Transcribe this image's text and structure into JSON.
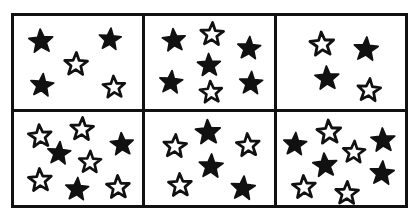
{
  "worksheet": {
    "title": "Star Counting Grid",
    "description": "Black and white worksheet image showing a 2 row by 3 column grid of boxes, each containing a mix of filled (black) and outline (white) five-pointed stars.",
    "background_color": "#ffffff",
    "line_color": "#111111",
    "filled_star_color": "#111111",
    "outline_star_fill": "#ffffff",
    "grid": {
      "rows": 2,
      "columns": 3,
      "border_width_px": 3
    },
    "cells": [
      {
        "id": "cell-1",
        "position": "top-left",
        "row": 1,
        "column": 1,
        "filled_count": 3,
        "outline_count": 2,
        "total_count": 5,
        "stars": [
          {
            "type": "filled",
            "x": 21,
            "y": 27,
            "size": 26,
            "rotation": -4
          },
          {
            "type": "filled",
            "x": 75,
            "y": 25,
            "size": 24,
            "rotation": 5
          },
          {
            "type": "outline",
            "x": 48,
            "y": 52,
            "size": 25,
            "rotation": 2
          },
          {
            "type": "filled",
            "x": 22,
            "y": 74,
            "size": 25,
            "rotation": 6
          },
          {
            "type": "outline",
            "x": 78,
            "y": 76,
            "size": 24,
            "rotation": -3
          }
        ]
      },
      {
        "id": "cell-2",
        "position": "top-middle",
        "row": 1,
        "column": 2,
        "filled_count": 5,
        "outline_count": 2,
        "total_count": 7,
        "stars": [
          {
            "type": "filled",
            "x": 22,
            "y": 26,
            "size": 25,
            "rotation": -5
          },
          {
            "type": "outline",
            "x": 52,
            "y": 19,
            "size": 25,
            "rotation": 3
          },
          {
            "type": "filled",
            "x": 81,
            "y": 34,
            "size": 25,
            "rotation": 4
          },
          {
            "type": "filled",
            "x": 50,
            "y": 53,
            "size": 25,
            "rotation": -2
          },
          {
            "type": "filled",
            "x": 20,
            "y": 71,
            "size": 25,
            "rotation": 5
          },
          {
            "type": "outline",
            "x": 51,
            "y": 82,
            "size": 24,
            "rotation": -4
          },
          {
            "type": "filled",
            "x": 82,
            "y": 72,
            "size": 25,
            "rotation": 3
          }
        ]
      },
      {
        "id": "cell-3",
        "position": "top-right",
        "row": 1,
        "column": 3,
        "filled_count": 2,
        "outline_count": 2,
        "total_count": 4,
        "stars": [
          {
            "type": "outline",
            "x": 35,
            "y": 30,
            "size": 26,
            "rotation": -4
          },
          {
            "type": "filled",
            "x": 70,
            "y": 35,
            "size": 26,
            "rotation": 4
          },
          {
            "type": "filled",
            "x": 39,
            "y": 67,
            "size": 26,
            "rotation": -3
          },
          {
            "type": "outline",
            "x": 72,
            "y": 80,
            "size": 25,
            "rotation": 5
          }
        ]
      },
      {
        "id": "cell-4",
        "position": "bottom-left",
        "row": 2,
        "column": 1,
        "filled_count": 3,
        "outline_count": 5,
        "total_count": 8,
        "stars": [
          {
            "type": "outline",
            "x": 20,
            "y": 26,
            "size": 25,
            "rotation": -5
          },
          {
            "type": "outline",
            "x": 53,
            "y": 18,
            "size": 25,
            "rotation": 3
          },
          {
            "type": "filled",
            "x": 35,
            "y": 44,
            "size": 25,
            "rotation": 5
          },
          {
            "type": "filled",
            "x": 84,
            "y": 34,
            "size": 25,
            "rotation": -4
          },
          {
            "type": "outline",
            "x": 59,
            "y": 54,
            "size": 24,
            "rotation": 2
          },
          {
            "type": "outline",
            "x": 20,
            "y": 73,
            "size": 25,
            "rotation": -3
          },
          {
            "type": "filled",
            "x": 49,
            "y": 83,
            "size": 25,
            "rotation": 4
          },
          {
            "type": "outline",
            "x": 81,
            "y": 81,
            "size": 25,
            "rotation": -2
          }
        ]
      },
      {
        "id": "cell-5",
        "position": "bottom-middle",
        "row": 2,
        "column": 2,
        "filled_count": 3,
        "outline_count": 3,
        "total_count": 6,
        "stars": [
          {
            "type": "filled",
            "x": 49,
            "y": 22,
            "size": 27,
            "rotation": -3
          },
          {
            "type": "outline",
            "x": 23,
            "y": 37,
            "size": 25,
            "rotation": 4
          },
          {
            "type": "outline",
            "x": 80,
            "y": 36,
            "size": 25,
            "rotation": -4
          },
          {
            "type": "filled",
            "x": 51,
            "y": 58,
            "size": 26,
            "rotation": 3
          },
          {
            "type": "outline",
            "x": 27,
            "y": 78,
            "size": 25,
            "rotation": -2
          },
          {
            "type": "filled",
            "x": 76,
            "y": 82,
            "size": 26,
            "rotation": 5
          }
        ]
      },
      {
        "id": "cell-6",
        "position": "bottom-right",
        "row": 2,
        "column": 3,
        "filled_count": 4,
        "outline_count": 4,
        "total_count": 8,
        "stars": [
          {
            "type": "outline",
            "x": 41,
            "y": 21,
            "size": 26,
            "rotation": -4
          },
          {
            "type": "filled",
            "x": 14,
            "y": 34,
            "size": 25,
            "rotation": 4
          },
          {
            "type": "filled",
            "x": 83,
            "y": 30,
            "size": 26,
            "rotation": -3
          },
          {
            "type": "outline",
            "x": 60,
            "y": 43,
            "size": 24,
            "rotation": 3
          },
          {
            "type": "filled",
            "x": 38,
            "y": 57,
            "size": 26,
            "rotation": -5
          },
          {
            "type": "filled",
            "x": 82,
            "y": 66,
            "size": 26,
            "rotation": 4
          },
          {
            "type": "outline",
            "x": 21,
            "y": 81,
            "size": 25,
            "rotation": -3
          },
          {
            "type": "outline",
            "x": 55,
            "y": 87,
            "size": 25,
            "rotation": 2
          }
        ]
      }
    ],
    "totals": {
      "filled_stars": 20,
      "outline_stars": 18,
      "all_stars": 38
    }
  }
}
